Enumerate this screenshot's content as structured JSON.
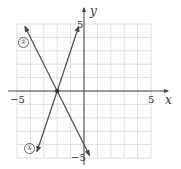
{
  "chart_data": {
    "type": "line",
    "title": "",
    "xlabel": "x",
    "ylabel": "y",
    "xlim": [
      -5,
      5
    ],
    "ylim": [
      -5,
      5
    ],
    "grid": true,
    "tick_labels": {
      "x_neg": "−5",
      "x_pos": "5",
      "y_pos": "5",
      "y_neg": "−5"
    },
    "series": [
      {
        "name": "①",
        "equation": "y = 3x + 6",
        "slope": 3,
        "intercept": 6,
        "x": [
          -3.5,
          -0.4
        ],
        "y": [
          -4.5,
          4.8
        ]
      },
      {
        "name": "②",
        "equation": "y = -2x - 4",
        "slope": -2,
        "intercept": -4,
        "x": [
          -4.4,
          0.4
        ],
        "y": [
          4.8,
          -4.8
        ]
      }
    ],
    "intersection": {
      "x": -2,
      "y": 0
    },
    "annotations": [
      "①",
      "②"
    ]
  },
  "colors": {
    "axis": "#444444",
    "grid": "#d8d8d8",
    "line": "#555555"
  }
}
